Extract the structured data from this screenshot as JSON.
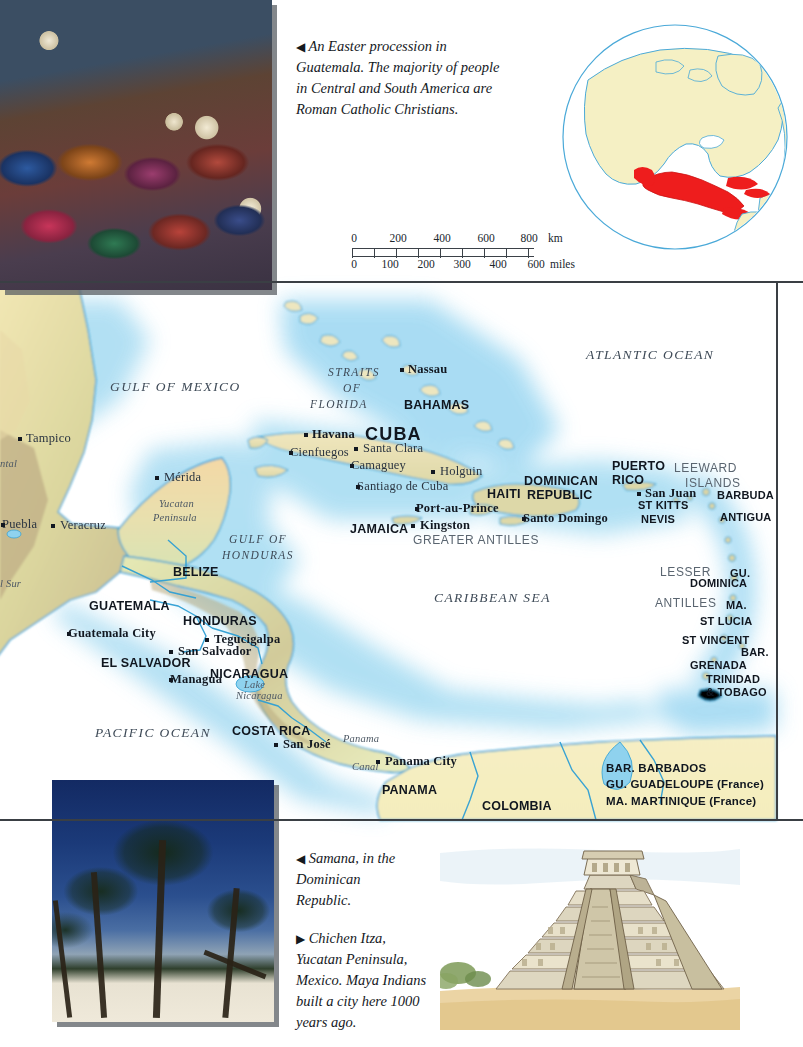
{
  "page": {
    "width": 803,
    "height": 1047
  },
  "colors": {
    "land": "#eef0c9",
    "land_highland": "#c9bb94",
    "land_lowland": "#d9e8c2",
    "shallow_water": "#9fd8f0",
    "deep_water": "#ffffff",
    "border_line": "#2f9fd4",
    "text_dark": "#10161f",
    "text_grey": "#5a6570",
    "highlight_red": "#ee1d1d",
    "globe_land": "#f5f0c4",
    "globe_outline": "#4aa9d8",
    "frame": "#3a3f44"
  },
  "captions": [
    {
      "id": "caption-procession",
      "arrow": "◀",
      "text": "An Easter procession in Guatemala. The majority of people in Central and South America are Roman Catholic Christians."
    },
    {
      "id": "caption-samana",
      "arrow": "◀",
      "text": "Samana, in the Dominican Republic."
    },
    {
      "id": "caption-chichen-itza",
      "arrow": "▶",
      "text": "Chichen Itza, Yucatan Peninsula, Mexico. Maya Indians built a city here 1000 years ago."
    }
  ],
  "photos": [
    {
      "id": "photo-procession",
      "alt": "An Easter procession in Guatemala"
    },
    {
      "id": "photo-palms",
      "alt": "Samana, Dominican Republic beach with palm trees"
    },
    {
      "id": "illus-pyramid",
      "alt": "Chichen Itza pyramid, Yucatan Peninsula"
    }
  ],
  "scale_bar": {
    "km": {
      "ticks": [
        "0",
        "200",
        "400",
        "600",
        "800"
      ],
      "unit": "km"
    },
    "miles": {
      "ticks": [
        "0",
        "100",
        "200",
        "300",
        "400",
        "600"
      ],
      "unit": "miles"
    }
  },
  "globe": {
    "id": "globe-inset",
    "highlight_region": "Mexico, Central America and the Caribbean",
    "highlight_color": "#ee1d1d"
  },
  "legend": {
    "entries": [
      {
        "abbr": "BAR.",
        "name": "BARBADOS",
        "note": ""
      },
      {
        "abbr": "GU.",
        "name": "GUADELOUPE",
        "note": "(France)"
      },
      {
        "abbr": "MA.",
        "name": "MARTINIQUE",
        "note": "(France)"
      }
    ]
  },
  "map_labels": {
    "oceans": [
      {
        "name": "ATLANTIC OCEAN",
        "x": 586,
        "y": 348,
        "size": "lg"
      },
      {
        "name": "PACIFIC OCEAN",
        "x": 95,
        "y": 726,
        "size": "lg"
      },
      {
        "name": "CARIBBEAN SEA",
        "x": 434,
        "y": 591,
        "size": "lg"
      },
      {
        "name": "GULF OF MEXICO",
        "x": 110,
        "y": 380,
        "size": "lg"
      }
    ],
    "seas_straits": [
      {
        "name": "STRAITS",
        "x": 328,
        "y": 366
      },
      {
        "name": "OF",
        "x": 343,
        "y": 382
      },
      {
        "name": "FLORIDA",
        "x": 310,
        "y": 398
      },
      {
        "name": "GULF OF",
        "x": 229,
        "y": 533
      },
      {
        "name": "HONDURAS",
        "x": 222,
        "y": 549
      }
    ],
    "countries": [
      {
        "name": "BAHAMAS",
        "x": 404,
        "y": 399,
        "size": "lg"
      },
      {
        "name": "CUBA",
        "x": 365,
        "y": 425,
        "size": "xl"
      },
      {
        "name": "JAMAICA",
        "x": 350,
        "y": 523,
        "size": "lg"
      },
      {
        "name": "HAITI",
        "x": 487,
        "y": 488,
        "size": "lg"
      },
      {
        "name": "DOMINICAN",
        "x": 524,
        "y": 475,
        "size": "lg"
      },
      {
        "name": "REPUBLIC",
        "x": 527,
        "y": 489,
        "size": "lg"
      },
      {
        "name": "PUERTO",
        "x": 612,
        "y": 460,
        "size": "lg"
      },
      {
        "name": "RICO",
        "x": 612,
        "y": 474,
        "size": "lg"
      },
      {
        "name": "ST KITTS",
        "x": 638,
        "y": 500,
        "size": "md"
      },
      {
        "name": "NEVIS",
        "x": 641,
        "y": 514,
        "size": "md"
      },
      {
        "name": "BARBUDA",
        "x": 717,
        "y": 490,
        "size": "md"
      },
      {
        "name": "ANTIGUA",
        "x": 720,
        "y": 512,
        "size": "md"
      },
      {
        "name": "DOMINICA",
        "x": 690,
        "y": 578,
        "size": "md"
      },
      {
        "name": "ST LUCIA",
        "x": 700,
        "y": 616,
        "size": "md"
      },
      {
        "name": "ST VINCENT",
        "x": 682,
        "y": 635,
        "size": "md"
      },
      {
        "name": "GRENADA",
        "x": 690,
        "y": 660,
        "size": "md"
      },
      {
        "name": "TRINIDAD",
        "x": 706,
        "y": 674,
        "size": "md"
      },
      {
        "name": "& TOBAGO",
        "x": 706,
        "y": 687,
        "size": "md"
      },
      {
        "name": "GU.",
        "x": 730,
        "y": 568,
        "size": "md"
      },
      {
        "name": "MA.",
        "x": 726,
        "y": 600,
        "size": "md"
      },
      {
        "name": "BAR.",
        "x": 741,
        "y": 647,
        "size": "md"
      },
      {
        "name": "BELIZE",
        "x": 173,
        "y": 566,
        "size": "lg"
      },
      {
        "name": "GUATEMALA",
        "x": 89,
        "y": 600,
        "size": "lg"
      },
      {
        "name": "HONDURAS",
        "x": 183,
        "y": 615,
        "size": "lg"
      },
      {
        "name": "EL SALVADOR",
        "x": 101,
        "y": 657,
        "size": "lg"
      },
      {
        "name": "NICARAGUA",
        "x": 210,
        "y": 668,
        "size": "lg"
      },
      {
        "name": "COSTA RICA",
        "x": 232,
        "y": 725,
        "size": "lg"
      },
      {
        "name": "PANAMA",
        "x": 382,
        "y": 784,
        "size": "lg"
      },
      {
        "name": "COLOMBIA",
        "x": 482,
        "y": 800,
        "size": "lg"
      }
    ],
    "regions": [
      {
        "name": "GREATER ANTILLES",
        "x": 413,
        "y": 534
      },
      {
        "name": "LEEWARD",
        "x": 674,
        "y": 462
      },
      {
        "name": "ISLANDS",
        "x": 685,
        "y": 477
      },
      {
        "name": "LESSER",
        "x": 660,
        "y": 566
      },
      {
        "name": "ANTILLES",
        "x": 655,
        "y": 597
      }
    ],
    "cities": [
      {
        "name": "Nassau",
        "x": 408,
        "y": 363,
        "dx": -7,
        "dy": 5,
        "anchor": "left",
        "bold": true
      },
      {
        "name": "Havana",
        "x": 312,
        "y": 428,
        "dx": -7,
        "dy": 5,
        "anchor": "left",
        "bold": true
      },
      {
        "name": "Santa Clara",
        "x": 363,
        "y": 442,
        "dx": -8,
        "dy": 5,
        "anchor": "left",
        "bold": false
      },
      {
        "name": "Cienfuegos",
        "x": 290,
        "y": 446,
        "dx": 0,
        "dy": 5,
        "anchor": "left",
        "bold": false
      },
      {
        "name": "Camaguey",
        "x": 351,
        "y": 459,
        "dx": 0,
        "dy": 5,
        "anchor": "left",
        "bold": false
      },
      {
        "name": "Holguin",
        "x": 440,
        "y": 465,
        "dx": -8,
        "dy": 5,
        "anchor": "left",
        "bold": false
      },
      {
        "name": "Santiago de Cuba",
        "x": 357,
        "y": 480,
        "dx": 0,
        "dy": 5,
        "anchor": "left",
        "bold": false
      },
      {
        "name": "Port-au-Prince",
        "x": 416,
        "y": 502,
        "dx": 0,
        "dy": 5,
        "anchor": "left",
        "bold": true
      },
      {
        "name": "Kingston",
        "x": 420,
        "y": 519,
        "dx": -8,
        "dy": 5,
        "anchor": "left",
        "bold": true
      },
      {
        "name": "Santo Domingo",
        "x": 523,
        "y": 512,
        "dx": 0,
        "dy": 5,
        "anchor": "left",
        "bold": true
      },
      {
        "name": "San Juan",
        "x": 645,
        "y": 487,
        "dx": -7,
        "dy": 5,
        "anchor": "left",
        "bold": true
      },
      {
        "name": "Tampico",
        "x": 26,
        "y": 432,
        "dx": -7,
        "dy": 5,
        "anchor": "left",
        "bold": false
      },
      {
        "name": "Mérida",
        "x": 164,
        "y": 471,
        "dx": -8,
        "dy": 5,
        "anchor": "left",
        "bold": false
      },
      {
        "name": "Puebla",
        "x": 2,
        "y": 518,
        "dx": 0,
        "dy": 5,
        "anchor": "left",
        "bold": false
      },
      {
        "name": "Veracruz",
        "x": 60,
        "y": 519,
        "dx": -8,
        "dy": 5,
        "anchor": "left",
        "bold": false
      },
      {
        "name": "Guatemala City",
        "x": 68,
        "y": 627,
        "dx": 0,
        "dy": 5,
        "anchor": "left",
        "bold": true
      },
      {
        "name": "Tegucigalpa",
        "x": 214,
        "y": 633,
        "dx": -8,
        "dy": 5,
        "anchor": "left",
        "bold": true
      },
      {
        "name": "San Salvador",
        "x": 178,
        "y": 645,
        "dx": -8,
        "dy": 5,
        "anchor": "left",
        "bold": true
      },
      {
        "name": "Managua",
        "x": 170,
        "y": 673,
        "dx": 0,
        "dy": 5,
        "anchor": "left",
        "bold": true
      },
      {
        "name": "San José",
        "x": 283,
        "y": 738,
        "dx": -8,
        "dy": 5,
        "anchor": "left",
        "bold": true
      },
      {
        "name": "Panama City",
        "x": 385,
        "y": 755,
        "dx": -8,
        "dy": 5,
        "anchor": "left",
        "bold": true
      }
    ],
    "physical": [
      {
        "name": "Yucatan",
        "x": 159,
        "y": 498
      },
      {
        "name": "Peninsula",
        "x": 153,
        "y": 512
      },
      {
        "name": "Lake",
        "x": 244,
        "y": 679
      },
      {
        "name": "Nicaragua",
        "x": 236,
        "y": 690
      },
      {
        "name": "Panama",
        "x": 343,
        "y": 733
      },
      {
        "name": "Canal",
        "x": 352,
        "y": 761
      },
      {
        "name": "ntal",
        "x": 0,
        "y": 458
      },
      {
        "name": "l Sur",
        "x": 0,
        "y": 578
      }
    ]
  }
}
